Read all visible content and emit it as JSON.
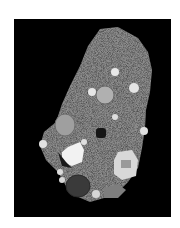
{
  "image": {
    "subject": "grayscale micrograph of a rock section with inclusions on black background",
    "background_color": "#000000",
    "margin_color": "#ffffff",
    "matrix_color": "#8a8a8a"
  }
}
